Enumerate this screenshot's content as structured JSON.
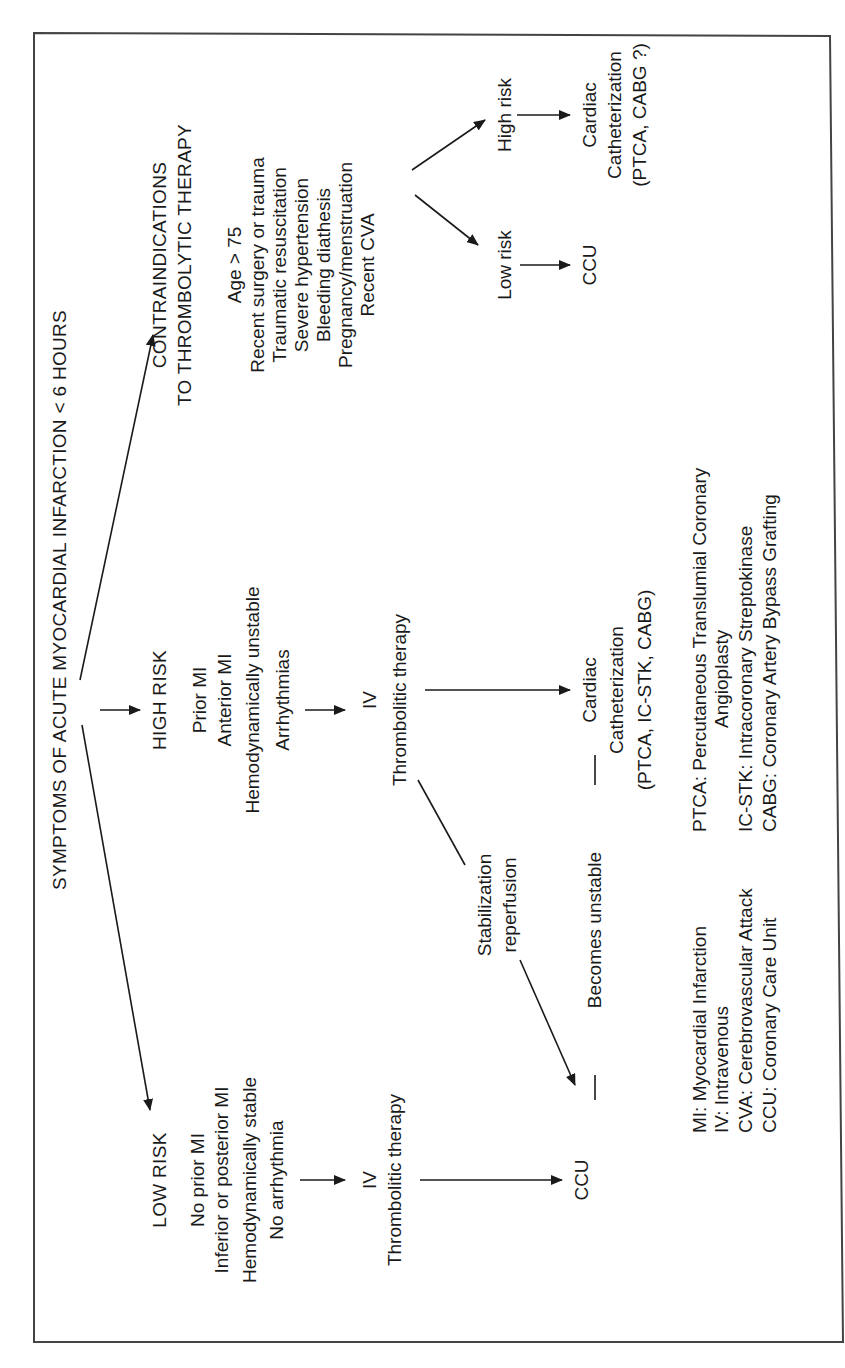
{
  "title": "SYMPTOMS OF ACUTE MYOCARDIAL INFARCTION < 6 HOURS",
  "low_risk": {
    "heading": "LOW RISK",
    "criteria": [
      "No prior MI",
      "Inferior or posterior MI",
      "Hemodynamically stable",
      "No arrhythmia"
    ],
    "iv": "IV",
    "therapy": "Thrombolitic therapy",
    "destination": "CCU"
  },
  "high_risk": {
    "heading": "HIGH RISK",
    "criteria": [
      "Prior MI",
      "Anterior MI",
      "Hemodynamically unstable",
      "Arrhythmias"
    ],
    "iv": "IV",
    "therapy": "Thrombolitic therapy",
    "destination": [
      "Cardiac",
      "Catheterization",
      "(PTCA, IC-STK, CABG)"
    ]
  },
  "stabilization": [
    "Stabilization",
    "reperfusion"
  ],
  "becomes_unstable": "Becomes unstable",
  "contraindications": {
    "heading": [
      "CONTRAINDICATIONS",
      "TO THROMBOLYTIC THERAPY"
    ],
    "items": [
      "Age > 75",
      "Recent surgery or trauma",
      "Traumatic resuscitation",
      "Severe hypertension",
      "Bleeding diathesis",
      "Pregnancy/menstruation",
      "Recent CVA"
    ],
    "high_risk_label": "High risk",
    "low_risk_label": "Low risk",
    "high_risk_destination": [
      "Cardiac",
      "Catheterization",
      "(PTCA, CABG ?)"
    ],
    "low_risk_destination": "CCU"
  },
  "legend": {
    "left": [
      "MI: Myocardial Infarction",
      "IV: Intravenous",
      "CVA: Cerebrovascular Attack",
      "CCU: Coronary Care Unit"
    ],
    "right": [
      "PTCA: Percutaneous Translumial Coronary",
      "Angioplasty",
      "IC-STK: Intracoronary Streptokinase",
      "CABG: Coronary Artery Bypass Grafting"
    ]
  }
}
